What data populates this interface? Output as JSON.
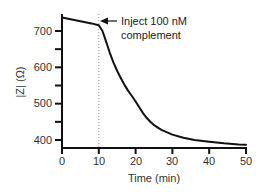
{
  "chart_data": {
    "type": "line",
    "title": "",
    "xlabel": "Time (min)",
    "ylabel": "|Z| (Ω)",
    "xlim": [
      0,
      50
    ],
    "ylim": [
      385,
      745
    ],
    "xticks": [
      0,
      10,
      20,
      30,
      40,
      50
    ],
    "yticks": [
      400,
      500,
      600,
      700
    ],
    "yminor_ticks": [
      450,
      550,
      650
    ],
    "grid": false,
    "legend": null,
    "series": [
      {
        "name": "|Z|",
        "x": [
          0,
          2,
          4,
          6,
          8,
          10,
          11,
          12,
          13,
          14,
          15,
          16,
          17,
          18,
          19,
          20,
          21,
          22,
          23,
          24,
          25,
          27,
          30,
          33,
          36,
          40,
          44,
          48,
          50
        ],
        "y": [
          737,
          733,
          729,
          725,
          721,
          716,
          700,
          670,
          640,
          613,
          590,
          570,
          551,
          535,
          521,
          506,
          490,
          474,
          461,
          450,
          441,
          428,
          415,
          406,
          400,
          395,
          391,
          388,
          387
        ]
      }
    ],
    "annotations": [
      {
        "text_line1": "Inject 100 nM",
        "text_line2": "complement",
        "arrow_to_x": 10,
        "arrow_to_y": 716,
        "vline_x": 10,
        "vline_style": "dotted"
      }
    ]
  },
  "labels": {
    "xlabel": "Time (min)",
    "ylabel": "|Z| (Ω)",
    "annotation_line1": "Inject 100 nM",
    "annotation_line2": "complement",
    "xtick_0": "0",
    "xtick_1": "10",
    "xtick_2": "20",
    "xtick_3": "30",
    "xtick_4": "40",
    "xtick_5": "50",
    "ytick_0": "400",
    "ytick_1": "500",
    "ytick_2": "600",
    "ytick_3": "700"
  }
}
